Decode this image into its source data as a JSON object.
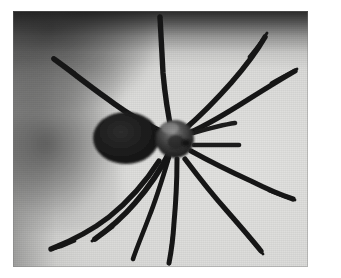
{
  "page": {
    "background_color": "#ffffff",
    "width": 341,
    "height": 278
  },
  "photograph": {
    "name": "spider-photograph",
    "caption": "",
    "medium": "black-and-white halftone photograph",
    "subject": "spider",
    "frame": {
      "x": 13,
      "y": 11,
      "width": 295,
      "height": 256
    },
    "background": {
      "base_color": "#dcdcda",
      "highlight_color": "#e3e3e1",
      "shadow_color": "#1c1c1c",
      "top_vignette": "dark band across upper edge",
      "left_shadow": "soft out-of-focus dark blob at middle-left"
    },
    "subject_colors": {
      "body_dark": "#1a1a1a",
      "body_mid": "#3a3a3a",
      "cephalothorax_highlight": "#6e6e6e",
      "leg_color": "#141414"
    }
  },
  "spider": {
    "name": "spider",
    "parts": {
      "abdomen": {
        "label": "abdomen",
        "cx": 113,
        "cy": 127,
        "rx": 33,
        "ry": 26
      },
      "cephalothorax": {
        "label": "cephalothorax",
        "cx": 162,
        "cy": 128,
        "rx": 19,
        "ry": 19
      },
      "pedipalps": {
        "label": "pedipalps",
        "count": 2
      },
      "legs": {
        "label": "legs",
        "count": 8
      }
    }
  }
}
